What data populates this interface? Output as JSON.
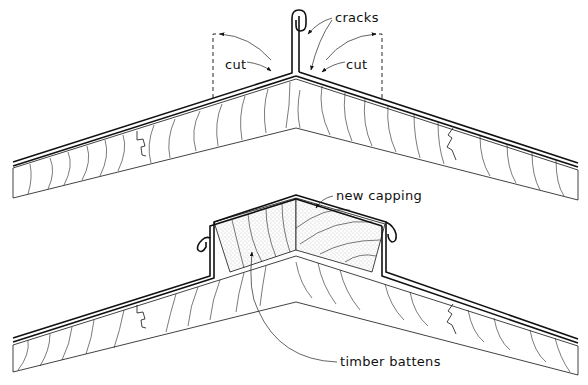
{
  "diagram": {
    "type": "technical-section-drawing",
    "top_panel": {
      "description": "existing ridge with cracked standing-seam capping",
      "labels": {
        "cracks": "cracks",
        "cut_left": "cut",
        "cut_right": "cut"
      }
    },
    "bottom_panel": {
      "description": "ridge with new capping fitted over timber battens",
      "labels": {
        "new_capping": "new capping",
        "timber_battens": "timber battens"
      }
    }
  },
  "colors": {
    "ink": "#111111",
    "background": "#ffffff",
    "stipple": "#9a9a9a"
  }
}
